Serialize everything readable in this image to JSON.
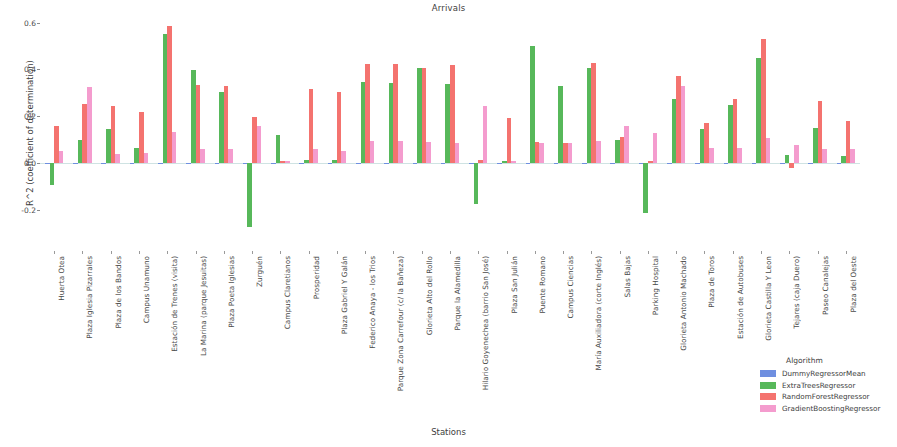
{
  "chart_data": {
    "type": "bar",
    "title": "Arrivals",
    "xlabel": "Stations",
    "ylabel": "R^2 (coefficient of determination)",
    "ylim": [
      -0.3,
      0.62
    ],
    "yticks": [
      0.6,
      0.4,
      0.2,
      0.0,
      -0.2
    ],
    "ytick_labels": [
      "0.6",
      "0.4",
      "0.2",
      "0.0",
      "-0.2"
    ],
    "grid": false,
    "legend_position": "lower right",
    "legend_title": "Algorithm",
    "categories": [
      "Huerta Otea",
      "Plaza Iglesia Pizarrales",
      "Plaza de los Bandos",
      "Campus Unamuno",
      "Estación de Trenes (visita)",
      "La Marina (parque Jesuitas)",
      "Plaza Poeta Iglesias",
      "Zurguén",
      "Campus Claretianos",
      "Prosperidad",
      "Plaza Gabriel Y Galán",
      "Federico Anaya - los Trios",
      "Parque Zona Carrefour (c/ la Bañeza)",
      "Glorieta Alto del Rollo",
      "Parque la Alamedilla",
      "Hilario Goyenechea (barrio San José)",
      "Plaza San Julián",
      "Puente Romano",
      "Campus Ciencias",
      "María Auxiliadora (corte Inglés)",
      "Salas Bajas",
      "Parking Hospital",
      "Glorieta Antonio Machado",
      "Plaza de Toros",
      "Estación de Autobuses",
      "Glorieta Castilla Y Leon",
      "Tejares (caja Duero)",
      "Paseo Canalejas",
      "Plaza del Oeste"
    ],
    "series": [
      {
        "name": "DummyRegressorMean",
        "color": "#6f8fe0",
        "values": [
          -0.002,
          -0.003,
          -0.004,
          -0.003,
          -0.002,
          -0.003,
          -0.003,
          -0.003,
          -0.003,
          -0.003,
          -0.003,
          -0.003,
          -0.003,
          -0.003,
          -0.003,
          -0.004,
          -0.003,
          -0.003,
          -0.003,
          -0.003,
          -0.003,
          -0.003,
          -0.003,
          -0.003,
          -0.003,
          -0.003,
          -0.004,
          -0.003,
          -0.003
        ]
      },
      {
        "name": "ExtraTreesRegressor",
        "color": "#57b85a",
        "values": [
          -0.095,
          0.1,
          0.145,
          0.062,
          0.553,
          0.398,
          0.302,
          -0.275,
          0.12,
          0.013,
          0.013,
          0.345,
          0.34,
          0.408,
          0.338,
          -0.175,
          0.01,
          0.5,
          0.328,
          0.405,
          0.1,
          -0.215,
          0.272,
          0.145,
          0.247,
          0.447,
          0.035,
          0.148,
          0.03
        ]
      },
      {
        "name": "RandomForestRegressor",
        "color": "#f4736f",
        "values": [
          0.158,
          0.253,
          0.243,
          0.218,
          0.585,
          0.333,
          0.33,
          0.197,
          0.008,
          0.318,
          0.305,
          0.425,
          0.422,
          0.408,
          0.42,
          0.013,
          0.193,
          0.088,
          0.085,
          0.428,
          0.113,
          0.01,
          0.37,
          0.172,
          0.272,
          0.53,
          -0.02,
          0.265,
          0.18
        ]
      },
      {
        "name": "GradientBoostingRegressor",
        "color": "#f49cce",
        "values": [
          0.052,
          0.325,
          0.037,
          0.042,
          0.133,
          0.058,
          0.058,
          0.16,
          0.008,
          0.058,
          0.052,
          0.092,
          0.095,
          0.09,
          0.085,
          0.242,
          0.008,
          0.085,
          0.085,
          0.095,
          0.16,
          0.13,
          0.33,
          0.062,
          0.063,
          0.105,
          0.078,
          0.06,
          0.058
        ]
      }
    ]
  }
}
